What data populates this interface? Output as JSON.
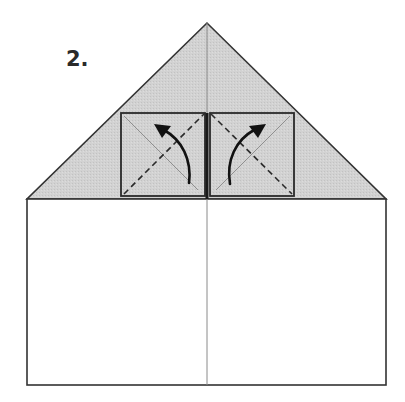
{
  "diagram": {
    "step_label": "2.",
    "colors": {
      "background": "#ffffff",
      "paper_white": "#ffffff",
      "paper_shaded": "#cfcfcf",
      "outline": "#333333",
      "center_crease": "#8a8a8a",
      "thin_diagonal": "#8f8f8f",
      "dashed_fold": "#2a2a2a",
      "arrow": "#111111"
    },
    "shapes": {
      "triangle_flap": {
        "apex": [
          207,
          23
        ],
        "base_left": [
          27,
          199
        ],
        "base_right": [
          386,
          199
        ]
      },
      "rectangle_body": {
        "x": 27,
        "y": 199,
        "width": 359,
        "height": 186
      },
      "center_crease": {
        "x": 207,
        "y1": 23,
        "y2": 385
      },
      "left_square": {
        "x": 121,
        "y": 113,
        "width": 84,
        "height": 83
      },
      "right_square": {
        "x": 210,
        "y": 113,
        "width": 84,
        "height": 83
      }
    },
    "annotations": [
      {
        "type": "valley-fold-line",
        "side": "left",
        "from": [
          124,
          194
        ],
        "to": [
          204,
          114
        ]
      },
      {
        "type": "valley-fold-line",
        "side": "right",
        "from": [
          211,
          114
        ],
        "to": [
          292,
          194
        ]
      },
      {
        "type": "existing-crease",
        "side": "left",
        "from": [
          124,
          116
        ],
        "to": [
          198,
          190
        ]
      },
      {
        "type": "existing-crease",
        "side": "right",
        "from": [
          216,
          190
        ],
        "to": [
          290,
          116
        ]
      },
      {
        "type": "fold-arrow",
        "side": "left",
        "direction": "up-left"
      },
      {
        "type": "fold-arrow",
        "side": "right",
        "direction": "up-right"
      }
    ]
  }
}
